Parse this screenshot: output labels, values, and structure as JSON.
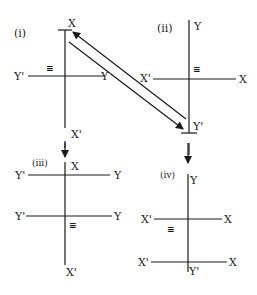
{
  "panels": [
    {
      "id": "i",
      "label": "(i)",
      "axes": {
        "top": "X",
        "bottom": "X'",
        "left": "Y'",
        "right": "Y"
      },
      "symbol": "≡"
    },
    {
      "id": "ii",
      "label": "(ii)",
      "axes": {
        "top": "Y",
        "bottom": "Y'",
        "left": "X'",
        "right": "X"
      },
      "symbol": "≡"
    },
    {
      "id": "iii",
      "label": "(iii)",
      "axes": {
        "top": "X",
        "bottom": "X'",
        "left1": "Y'",
        "right1": "Y",
        "left2": "Y'",
        "right2": "Y"
      },
      "symbol": "≡"
    },
    {
      "id": "iv",
      "label": "(iv)",
      "axes": {
        "top": "Y",
        "bottom": "Y'",
        "left1": "X'",
        "right1": "X",
        "left2": "X'",
        "right2": "X"
      },
      "symbol": "≡"
    }
  ],
  "arrows": [
    {
      "from": "ii",
      "to": "i",
      "type": "diagonal"
    },
    {
      "from": "i",
      "to": "ii",
      "type": "diagonal"
    },
    {
      "from": "i",
      "to": "iii",
      "type": "down"
    },
    {
      "from": "ii",
      "to": "iv",
      "type": "down"
    }
  ]
}
